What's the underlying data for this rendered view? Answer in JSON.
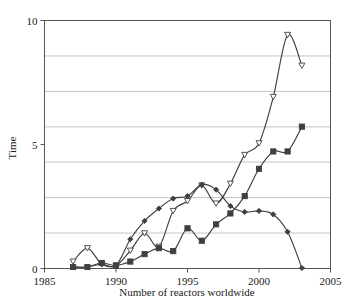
{
  "chart_data": {
    "type": "line",
    "title": "",
    "subtitle": "",
    "xlabel": "Number of reactors worldwide",
    "ylabel": "Time",
    "xlim": [
      1985,
      2005
    ],
    "ylim": [
      0,
      10
    ],
    "xticks": [
      1985,
      1990,
      1995,
      2000,
      2005
    ],
    "xtick_labels": [
      "1985",
      "1990",
      "1995",
      "2000",
      "2005"
    ],
    "yticks": [
      0,
      5,
      10
    ],
    "ytick_labels": [
      "0",
      "5",
      "10"
    ],
    "grid": {
      "horizontal": true,
      "vertical": false,
      "y_values": [
        1.43,
        2.86,
        4.29,
        5.71,
        7.14,
        8.57
      ],
      "color": "#b5b5b5"
    },
    "legend": {
      "visible": false,
      "position": "none"
    },
    "annotations": [],
    "series": [
      {
        "name": "series-triangle",
        "marker": "triangle-down",
        "marker_fill": "#ffffff",
        "color": "#3f3f3f",
        "x": [
          1987,
          1988,
          1989,
          1990,
          1991,
          1992,
          1993,
          1994,
          1995,
          1996,
          1997,
          1998,
          1999,
          2000,
          2001,
          2002,
          2003
        ],
        "values": [
          0.28,
          0.82,
          0.18,
          0.12,
          0.72,
          1.42,
          0.88,
          2.32,
          2.72,
          3.35,
          2.62,
          3.42,
          4.58,
          5.05,
          6.92,
          9.42,
          8.18
        ]
      },
      {
        "name": "series-diamond",
        "marker": "diamond",
        "marker_fill": "#3f3f3f",
        "color": "#3f3f3f",
        "x": [
          1987,
          1988,
          1989,
          1990,
          1991,
          1992,
          1993,
          1994,
          1995,
          1996,
          1997,
          1998,
          1999,
          2000,
          2001,
          2002,
          2003
        ],
        "values": [
          0.06,
          0.06,
          0.18,
          0.12,
          1.18,
          1.92,
          2.42,
          2.82,
          2.92,
          3.38,
          3.18,
          2.52,
          2.28,
          2.32,
          2.18,
          1.48,
          0.02
        ]
      },
      {
        "name": "series-square",
        "marker": "square",
        "marker_fill": "#3f3f3f",
        "color": "#3f3f3f",
        "x": [
          1987,
          1988,
          1989,
          1990,
          1991,
          1992,
          1993,
          1994,
          1995,
          1996,
          1997,
          1998,
          1999,
          2000,
          2001,
          2002,
          2003
        ],
        "values": [
          0.06,
          0.06,
          0.22,
          0.12,
          0.28,
          0.58,
          0.82,
          0.7,
          1.62,
          1.12,
          1.78,
          2.22,
          2.92,
          4.02,
          4.72,
          4.72,
          5.72
        ]
      }
    ]
  },
  "axes": {
    "y_label_text": "Time",
    "x_label_text": "Number of reactors worldwide"
  },
  "style": {
    "frame_color": "#555555",
    "grid_color": "#bcbcbc",
    "line_color": "#3f3f3f",
    "background": "#ffffff"
  }
}
